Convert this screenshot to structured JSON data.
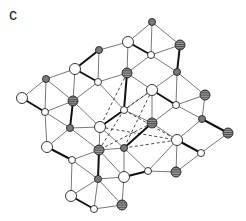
{
  "panel": {
    "label": "c"
  },
  "diagram": {
    "node_types": {
      "large_white": {
        "r": 5.5,
        "fill": "#ffffff"
      },
      "small_white": {
        "r": 3.5,
        "fill": "#ffffff"
      },
      "small_gray": {
        "r": 3.5,
        "fill": "#7a7a7a"
      },
      "striped": {
        "r": 5,
        "fill": "#8a8a8a"
      }
    },
    "nodes": [
      {
        "id": "n1",
        "x": 152,
        "y": 22,
        "type": "small_gray"
      },
      {
        "id": "n2",
        "x": 128,
        "y": 42,
        "type": "large_white"
      },
      {
        "id": "n3",
        "x": 180,
        "y": 45,
        "type": "striped"
      },
      {
        "id": "n4",
        "x": 99,
        "y": 50,
        "type": "small_gray"
      },
      {
        "id": "n5",
        "x": 151,
        "y": 55,
        "type": "small_white"
      },
      {
        "id": "n6",
        "x": 75,
        "y": 69,
        "type": "large_white"
      },
      {
        "id": "n7",
        "x": 127,
        "y": 73,
        "type": "striped"
      },
      {
        "id": "n8",
        "x": 177,
        "y": 72,
        "type": "small_gray"
      },
      {
        "id": "n9",
        "x": 46,
        "y": 79,
        "type": "small_gray"
      },
      {
        "id": "n10",
        "x": 98,
        "y": 82,
        "type": "small_white"
      },
      {
        "id": "n11",
        "x": 152,
        "y": 90,
        "type": "large_white"
      },
      {
        "id": "n12",
        "x": 205,
        "y": 95,
        "type": "striped"
      },
      {
        "id": "n13",
        "x": 22,
        "y": 98,
        "type": "large_white"
      },
      {
        "id": "n14",
        "x": 73,
        "y": 101,
        "type": "striped"
      },
      {
        "id": "n15",
        "x": 124,
        "y": 110,
        "type": "small_white"
      },
      {
        "id": "n16",
        "x": 176,
        "y": 105,
        "type": "small_white"
      },
      {
        "id": "n17",
        "x": 45,
        "y": 112,
        "type": "small_white"
      },
      {
        "id": "n18",
        "x": 100,
        "y": 127,
        "type": "large_white"
      },
      {
        "id": "n19",
        "x": 152,
        "y": 123,
        "type": "striped"
      },
      {
        "id": "n20",
        "x": 70,
        "y": 128,
        "type": "small_gray"
      },
      {
        "id": "n21",
        "x": 202,
        "y": 119,
        "type": "small_gray"
      },
      {
        "id": "n22",
        "x": 228,
        "y": 133,
        "type": "striped"
      },
      {
        "id": "n23",
        "x": 124,
        "y": 148,
        "type": "small_gray"
      },
      {
        "id": "n24",
        "x": 177,
        "y": 140,
        "type": "large_white"
      },
      {
        "id": "n25",
        "x": 47,
        "y": 147,
        "type": "large_white"
      },
      {
        "id": "n26",
        "x": 99,
        "y": 150,
        "type": "striped"
      },
      {
        "id": "n27",
        "x": 201,
        "y": 153,
        "type": "small_white"
      },
      {
        "id": "n28",
        "x": 72,
        "y": 160,
        "type": "small_white"
      },
      {
        "id": "n29",
        "x": 148,
        "y": 171,
        "type": "small_white"
      },
      {
        "id": "n30",
        "x": 124,
        "y": 177,
        "type": "large_white"
      },
      {
        "id": "n31",
        "x": 176,
        "y": 172,
        "type": "striped"
      },
      {
        "id": "n32",
        "x": 98,
        "y": 179,
        "type": "small_gray"
      },
      {
        "id": "n33",
        "x": 71,
        "y": 196,
        "type": "large_white"
      },
      {
        "id": "n34",
        "x": 122,
        "y": 205,
        "type": "striped"
      },
      {
        "id": "n35",
        "x": 94,
        "y": 209,
        "type": "small_white"
      }
    ],
    "edges": [
      [
        "n1",
        "n2"
      ],
      [
        "n1",
        "n3"
      ],
      [
        "n1",
        "n5"
      ],
      [
        "n2",
        "n4"
      ],
      [
        "n2",
        "n5"
      ],
      [
        "n2",
        "n7"
      ],
      [
        "n3",
        "n5"
      ],
      [
        "n3",
        "n8"
      ],
      [
        "n4",
        "n6"
      ],
      [
        "n4",
        "n10"
      ],
      [
        "n5",
        "n7"
      ],
      [
        "n5",
        "n8"
      ],
      [
        "n6",
        "n9"
      ],
      [
        "n6",
        "n10"
      ],
      [
        "n6",
        "n14"
      ],
      [
        "n7",
        "n10"
      ],
      [
        "n7",
        "n11"
      ],
      [
        "n7",
        "n15"
      ],
      [
        "n8",
        "n11"
      ],
      [
        "n8",
        "n12"
      ],
      [
        "n8",
        "n16"
      ],
      [
        "n9",
        "n13"
      ],
      [
        "n9",
        "n14"
      ],
      [
        "n9",
        "n17"
      ],
      [
        "n10",
        "n14"
      ],
      [
        "n10",
        "n15"
      ],
      [
        "n11",
        "n15"
      ],
      [
        "n11",
        "n16"
      ],
      [
        "n11",
        "n19"
      ],
      [
        "n12",
        "n16"
      ],
      [
        "n12",
        "n21"
      ],
      [
        "n13",
        "n17"
      ],
      [
        "n14",
        "n17"
      ],
      [
        "n14",
        "n18"
      ],
      [
        "n14",
        "n20"
      ],
      [
        "n15",
        "n18"
      ],
      [
        "n15",
        "n19"
      ],
      [
        "n16",
        "n19"
      ],
      [
        "n16",
        "n21"
      ],
      [
        "n17",
        "n20"
      ],
      [
        "n17",
        "n25"
      ],
      [
        "n18",
        "n20"
      ],
      [
        "n18",
        "n23"
      ],
      [
        "n18",
        "n26"
      ],
      [
        "n19",
        "n23"
      ],
      [
        "n19",
        "n24"
      ],
      [
        "n21",
        "n22"
      ],
      [
        "n21",
        "n24"
      ],
      [
        "n22",
        "n27"
      ],
      [
        "n20",
        "n25"
      ],
      [
        "n20",
        "n26"
      ],
      [
        "n23",
        "n26"
      ],
      [
        "n23",
        "n29"
      ],
      [
        "n24",
        "n27"
      ],
      [
        "n24",
        "n29"
      ],
      [
        "n24",
        "n31"
      ],
      [
        "n25",
        "n28"
      ],
      [
        "n26",
        "n28"
      ],
      [
        "n26",
        "n30"
      ],
      [
        "n26",
        "n32"
      ],
      [
        "n27",
        "n31"
      ],
      [
        "n23",
        "n30"
      ],
      [
        "n29",
        "n30"
      ],
      [
        "n29",
        "n31"
      ],
      [
        "n28",
        "n32"
      ],
      [
        "n28",
        "n33"
      ],
      [
        "n30",
        "n32"
      ],
      [
        "n30",
        "n34"
      ],
      [
        "n32",
        "n33"
      ],
      [
        "n32",
        "n34"
      ],
      [
        "n32",
        "n35"
      ],
      [
        "n33",
        "n35"
      ],
      [
        "n34",
        "n35"
      ]
    ],
    "bold_edges": [
      [
        "n2",
        "n5"
      ],
      [
        "n3",
        "n8"
      ],
      [
        "n6",
        "n10"
      ],
      [
        "n4",
        "n6"
      ],
      [
        "n13",
        "n17"
      ],
      [
        "n14",
        "n20"
      ],
      [
        "n11",
        "n16"
      ],
      [
        "n7",
        "n15"
      ],
      [
        "n19",
        "n23"
      ],
      [
        "n18",
        "n15"
      ],
      [
        "n21",
        "n22"
      ],
      [
        "n24",
        "n27"
      ],
      [
        "n25",
        "n28"
      ],
      [
        "n26",
        "n32"
      ],
      [
        "n29",
        "n30"
      ],
      [
        "n33",
        "n35"
      ]
    ],
    "dashed_edges": [
      [
        "n7",
        "n18"
      ],
      [
        "n11",
        "n23"
      ],
      [
        "n15",
        "n24"
      ],
      [
        "n18",
        "n24"
      ],
      [
        "n15",
        "n26"
      ],
      [
        "n11",
        "n18"
      ],
      [
        "n19",
        "n26"
      ],
      [
        "n23",
        "n24"
      ]
    ]
  }
}
